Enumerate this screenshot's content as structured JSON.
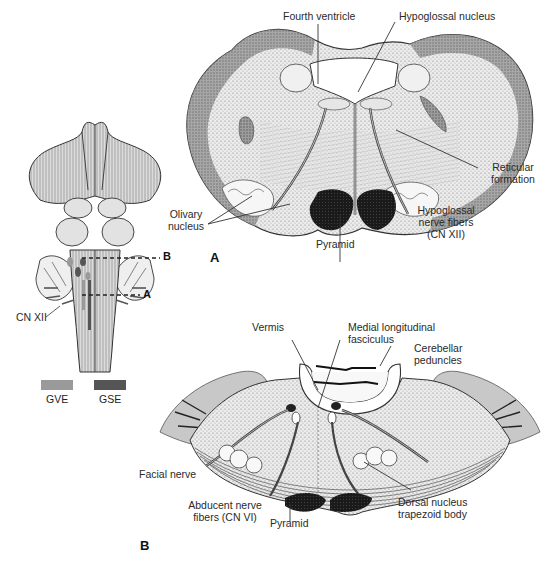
{
  "figure": {
    "panels": [
      {
        "id": "A",
        "letter": "A",
        "description": "Cross-section of medulla at level A",
        "labels": {
          "fourth_ventricle": "Fourth ventricle",
          "hypoglossal_nucleus": "Hypoglossal nucleus",
          "reticular_formation_1": "Reticular",
          "reticular_formation_2": "formation",
          "olivary_nucleus_1": "Olivary",
          "olivary_nucleus_2": "nucleus",
          "pyramid": "Pyramid",
          "hypoglossal_fibers_1": "Hypoglossal",
          "hypoglossal_fibers_2": "nerve fibers",
          "hypoglossal_fibers_3": "(CN XII)"
        }
      },
      {
        "id": "B",
        "letter": "B",
        "description": "Cross-section of pons at level B",
        "labels": {
          "vermis": "Vermis",
          "mlf_1": "Medial longitudinal",
          "mlf_2": "fasciculus",
          "cerebellar_peduncles_1": "Cerebellar",
          "cerebellar_peduncles_2": "peduncles",
          "facial_nerve": "Facial nerve",
          "abducent_1": "Abducent nerve",
          "abducent_2": "fibers (CN VI)",
          "pyramid": "Pyramid",
          "dorsal_nucleus_1": "Dorsal nucleus",
          "dorsal_nucleus_2": "trapezoid body"
        }
      }
    ],
    "brainstem_view": {
      "level_markers": [
        {
          "letter": "B"
        },
        {
          "letter": "A"
        }
      ],
      "cn_label": "CN XII"
    },
    "legend": [
      {
        "label": "GVE",
        "color": "#9a9a9a"
      },
      {
        "label": "GSE",
        "color": "#555555"
      }
    ]
  }
}
